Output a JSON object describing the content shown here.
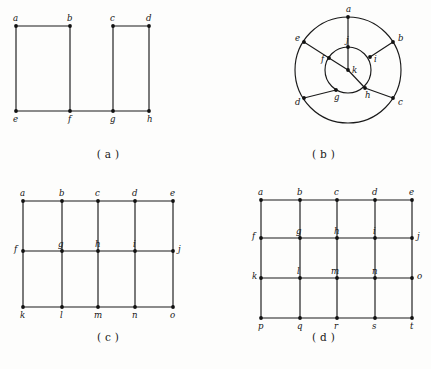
{
  "figure": {
    "background_color": "#fdfdfc",
    "line_color": "#1a1a1a",
    "vertex_color": "#111111",
    "panels": [
      {
        "id": "a",
        "caption": "( a )",
        "type": "two-disjoint-rectangles",
        "vertices": [
          {
            "label": "a",
            "x": 16,
            "y": 26,
            "label_dx": -3,
            "label_dy": -5
          },
          {
            "label": "b",
            "x": 70,
            "y": 26,
            "label_dx": -3,
            "label_dy": -5
          },
          {
            "label": "c",
            "x": 113,
            "y": 26,
            "label_dx": -3,
            "label_dy": -5
          },
          {
            "label": "d",
            "x": 149,
            "y": 26,
            "label_dx": -3,
            "label_dy": -5
          },
          {
            "label": "e",
            "x": 16,
            "y": 111,
            "label_dx": -3,
            "label_dy": 11
          },
          {
            "label": "f",
            "x": 70,
            "y": 111,
            "label_dx": -2,
            "label_dy": 11
          },
          {
            "label": "g",
            "x": 113,
            "y": 111,
            "label_dx": -3,
            "label_dy": 11
          },
          {
            "label": "h",
            "x": 149,
            "y": 111,
            "label_dx": -2,
            "label_dy": 11
          }
        ],
        "edges": [
          [
            "a",
            "b"
          ],
          [
            "a",
            "e"
          ],
          [
            "b",
            "f"
          ],
          [
            "e",
            "f"
          ],
          [
            "c",
            "d"
          ],
          [
            "c",
            "g"
          ],
          [
            "d",
            "h"
          ],
          [
            "g",
            "h"
          ],
          [
            "f",
            "g"
          ]
        ]
      },
      {
        "id": "b",
        "caption": "( b )",
        "type": "concentric-wheel",
        "center": {
          "x": 132,
          "y": 70
        },
        "outer_radius": 53,
        "inner_radius": 23,
        "vertices": [
          {
            "label": "a",
            "x": 132,
            "y": 17,
            "label_dx": -2,
            "label_dy": -5
          },
          {
            "label": "b",
            "x": 177,
            "y": 42,
            "label_dx": 5,
            "label_dy": -1
          },
          {
            "label": "c",
            "x": 177,
            "y": 98,
            "label_dx": 5,
            "label_dy": 7
          },
          {
            "label": "d",
            "x": 88,
            "y": 98,
            "label_dx": -9,
            "label_dy": 7
          },
          {
            "label": "e",
            "x": 88,
            "y": 42,
            "label_dx": -9,
            "label_dy": -1
          },
          {
            "label": "f",
            "x": 113,
            "y": 58,
            "label_dx": -8,
            "label_dy": 4
          },
          {
            "label": "g",
            "x": 120,
            "y": 90,
            "label_dx": -2,
            "label_dy": 10
          },
          {
            "label": "h",
            "x": 149,
            "y": 88,
            "label_dx": 0,
            "label_dy": 10
          },
          {
            "label": "i",
            "x": 154,
            "y": 57,
            "label_dx": 4,
            "label_dy": 5
          },
          {
            "label": "j",
            "x": 132,
            "y": 47,
            "label_dx": -2,
            "label_dy": -4
          },
          {
            "label": "k",
            "x": 132,
            "y": 70,
            "label_dx": 4,
            "label_dy": 3
          }
        ],
        "edges": [
          [
            "a",
            "j"
          ],
          [
            "e",
            "f"
          ],
          [
            "b",
            "i"
          ],
          [
            "c",
            "h"
          ],
          [
            "d",
            "g"
          ],
          [
            "k",
            "j"
          ],
          [
            "k",
            "f"
          ],
          [
            "k",
            "h"
          ]
        ]
      },
      {
        "id": "c",
        "caption": "( c )",
        "type": "grid-3x5",
        "columns_x": [
          23,
          62,
          98,
          135,
          173
        ],
        "rows_y": [
          21,
          71,
          127
        ],
        "vertices": [
          {
            "label": "a",
            "col": 0,
            "row": 0,
            "label_dx": -3,
            "label_dy": -5
          },
          {
            "label": "b",
            "col": 1,
            "row": 0,
            "label_dx": -3,
            "label_dy": -5
          },
          {
            "label": "c",
            "col": 2,
            "row": 0,
            "label_dx": -3,
            "label_dy": -5
          },
          {
            "label": "d",
            "col": 3,
            "row": 0,
            "label_dx": -3,
            "label_dy": -5
          },
          {
            "label": "e",
            "col": 4,
            "row": 0,
            "label_dx": -3,
            "label_dy": -5
          },
          {
            "label": "f",
            "col": 0,
            "row": 1,
            "label_dx": -9,
            "label_dy": 1
          },
          {
            "label": "g",
            "col": 1,
            "row": 1,
            "label_dx": -4,
            "label_dy": -4
          },
          {
            "label": "h",
            "col": 2,
            "row": 1,
            "label_dx": -3,
            "label_dy": -4
          },
          {
            "label": "i",
            "col": 3,
            "row": 1,
            "label_dx": -2,
            "label_dy": -4
          },
          {
            "label": "j",
            "col": 4,
            "row": 1,
            "label_dx": 5,
            "label_dy": 1
          },
          {
            "label": "k",
            "col": 0,
            "row": 2,
            "label_dx": -3,
            "label_dy": 11
          },
          {
            "label": "l",
            "col": 1,
            "row": 2,
            "label_dx": -2,
            "label_dy": 11
          },
          {
            "label": "m",
            "col": 2,
            "row": 2,
            "label_dx": -4,
            "label_dy": 11
          },
          {
            "label": "n",
            "col": 3,
            "row": 2,
            "label_dx": -3,
            "label_dy": 11
          },
          {
            "label": "o",
            "col": 4,
            "row": 2,
            "label_dx": -3,
            "label_dy": 11
          }
        ],
        "horizontal_rows": [
          0,
          1,
          2
        ],
        "vertical_cols": [
          0,
          1,
          2,
          3,
          4
        ]
      },
      {
        "id": "d",
        "caption": "( d )",
        "type": "grid-4x5",
        "columns_x": [
          45,
          84,
          121,
          159,
          196
        ],
        "rows_y": [
          20,
          58,
          98,
          138
        ],
        "vertices": [
          {
            "label": "a",
            "col": 0,
            "row": 0,
            "label_dx": -3,
            "label_dy": -5
          },
          {
            "label": "b",
            "col": 1,
            "row": 0,
            "label_dx": -3,
            "label_dy": -5
          },
          {
            "label": "c",
            "col": 2,
            "row": 0,
            "label_dx": -3,
            "label_dy": -5
          },
          {
            "label": "d",
            "col": 3,
            "row": 0,
            "label_dx": -3,
            "label_dy": -5
          },
          {
            "label": "e",
            "col": 4,
            "row": 0,
            "label_dx": -3,
            "label_dy": -5
          },
          {
            "label": "f",
            "col": 0,
            "row": 1,
            "label_dx": -9,
            "label_dy": 1
          },
          {
            "label": "g",
            "col": 1,
            "row": 1,
            "label_dx": -4,
            "label_dy": -4
          },
          {
            "label": "h",
            "col": 2,
            "row": 1,
            "label_dx": -3,
            "label_dy": -4
          },
          {
            "label": "i",
            "col": 3,
            "row": 1,
            "label_dx": -2,
            "label_dy": -4
          },
          {
            "label": "j",
            "col": 4,
            "row": 1,
            "label_dx": 5,
            "label_dy": 1
          },
          {
            "label": "k",
            "col": 0,
            "row": 2,
            "label_dx": -9,
            "label_dy": 1
          },
          {
            "label": "l",
            "col": 1,
            "row": 2,
            "label_dx": -3,
            "label_dy": -4
          },
          {
            "label": "m",
            "col": 2,
            "row": 2,
            "label_dx": -6,
            "label_dy": -4
          },
          {
            "label": "n",
            "col": 3,
            "row": 2,
            "label_dx": -3,
            "label_dy": -4
          },
          {
            "label": "o",
            "col": 4,
            "row": 2,
            "label_dx": 5,
            "label_dy": 1
          },
          {
            "label": "p",
            "col": 0,
            "row": 3,
            "label_dx": -3,
            "label_dy": 11
          },
          {
            "label": "q",
            "col": 1,
            "row": 3,
            "label_dx": -3,
            "label_dy": 11
          },
          {
            "label": "r",
            "col": 2,
            "row": 3,
            "label_dx": -3,
            "label_dy": 11
          },
          {
            "label": "s",
            "col": 3,
            "row": 3,
            "label_dx": -3,
            "label_dy": 11
          },
          {
            "label": "t",
            "col": 4,
            "row": 3,
            "label_dx": -2,
            "label_dy": 11
          }
        ],
        "horizontal_rows": [
          0,
          1,
          2,
          3
        ],
        "vertical_cols": [
          0,
          1,
          2,
          3,
          4
        ]
      }
    ]
  }
}
